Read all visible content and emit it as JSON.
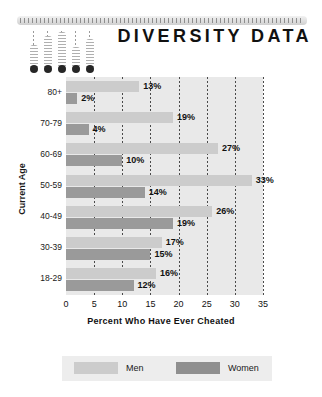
{
  "header": {
    "title": "DIVERSITY DATA",
    "ruler_icon": "dotted-ruler-bar",
    "thermometers": [
      {
        "name": "thermometer-1",
        "height": 22,
        "left": 0,
        "lead": 14
      },
      {
        "name": "thermometer-2",
        "height": 31,
        "left": 14,
        "lead": 5
      },
      {
        "name": "thermometer-3",
        "height": 35,
        "left": 28,
        "lead": 1
      },
      {
        "name": "thermometer-4",
        "height": 20,
        "left": 42,
        "lead": 16
      },
      {
        "name": "thermometer-5",
        "height": 28,
        "left": 56,
        "lead": 8
      }
    ]
  },
  "chart_data": {
    "type": "bar",
    "orientation": "horizontal",
    "title": "DIVERSITY DATA",
    "xlabel": "Percent Who Have Ever Cheated",
    "ylabel": "Current Age",
    "categories": [
      "80+",
      "70-79",
      "60-69",
      "50-59",
      "40-49",
      "30-39",
      "18-29"
    ],
    "series": [
      {
        "name": "Men",
        "color": "#cccccc",
        "values": [
          13,
          19,
          27,
          33,
          26,
          17,
          16
        ]
      },
      {
        "name": "Women",
        "color": "#9a9a9a",
        "values": [
          2,
          4,
          10,
          14,
          19,
          15,
          12
        ]
      }
    ],
    "value_labels": {
      "Men": [
        "13%",
        "19%",
        "27%",
        "33%",
        "26%",
        "17%",
        "16%"
      ],
      "Women": [
        "2%",
        "4%",
        "10%",
        "14%",
        "19%",
        "15%",
        "12%"
      ]
    },
    "xlim": [
      0,
      35
    ],
    "xticks": [
      0,
      5,
      10,
      15,
      20,
      25,
      30,
      35
    ],
    "xtick_labels": [
      "0",
      "5",
      "10",
      "15",
      "20",
      "25",
      "30",
      "35"
    ],
    "grid": true,
    "grid_style": "dotted-vertical",
    "legend_position": "bottom",
    "plot_background": "#e9e9e9"
  },
  "legend": {
    "entries": [
      {
        "label": "Men",
        "color": "#cccccc"
      },
      {
        "label": "Women",
        "color": "#8f8f8f"
      }
    ]
  }
}
